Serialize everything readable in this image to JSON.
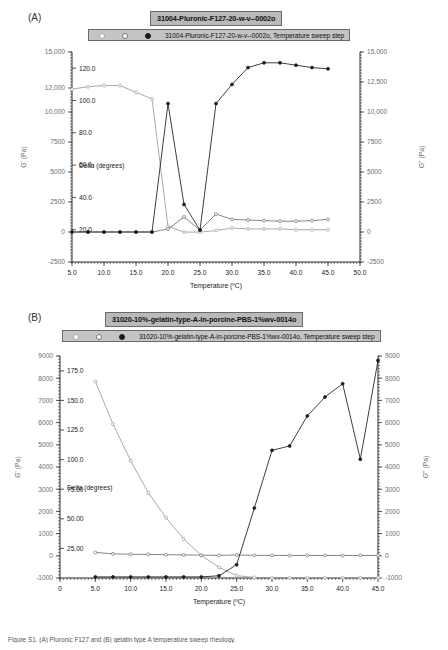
{
  "figure": {
    "caption": "Figure S1. (A) Pluronic F127 and (B) gelatin type A temperature sweep rheology."
  },
  "panels": [
    {
      "label": "(A)",
      "title": "31004-Pluronic-F127-20-w-v--0002o",
      "legend_text": "31004-Pluronic-F127-20-w-v--0002o, Temperature sweep step",
      "xlabel": "Temperature (ºC)",
      "ylabel_left": "G' (Pa)",
      "ylabel_left2": "Delta (degrees)",
      "ylabel_right": "G'' (Pa)",
      "colors": {
        "delta": "#9a9a9a",
        "gpp": "#6f6f6f",
        "gp": "#1c1c1c"
      }
    },
    {
      "label": "(B)",
      "title": "31020-10%-gelatin-type-A-in-porcine-PBS-1%wv-0014o",
      "legend_text": "31020-10%-gelatin-type-A-in-porcine-PBS-1%wv-0014o, Temperature sweep step",
      "xlabel": "Temperature (ºC)",
      "ylabel_left": "G' (Pa)",
      "ylabel_left2": "Delta (degrees)",
      "ylabel_right": "G'' (Pa)",
      "colors": {
        "delta": "#9a9a9a",
        "gpp": "#6f6f6f",
        "gp": "#1c1c1c"
      }
    }
  ],
  "chart_data": [
    {
      "type": "line",
      "title": "31004-Pluronic-F127-20-w-v--0002o",
      "subtitle": "31004-Pluronic-F127-20-w-v--0002o, Temperature sweep step",
      "xlabel": "Temperature (ºC)",
      "ylabel": "G' (Pa)",
      "ylabel_secondary": "G'' (Pa)",
      "ylabel_tertiary": "Delta (degrees)",
      "grid": false,
      "legend_position": "top",
      "xlim": [
        5.0,
        50.0
      ],
      "xticks": [
        "5.0",
        "10.0",
        "15.0",
        "20.0",
        "25.0",
        "30.0",
        "35.0",
        "40.0",
        "45.0",
        "50.0"
      ],
      "ylim_left": [
        -2500,
        15000
      ],
      "yticks_left": [
        "-2500",
        "0",
        "2500",
        "5000",
        "7500",
        "10,000",
        "12,000",
        "15,000"
      ],
      "ylim_delta": [
        0.0,
        130.0
      ],
      "yticks_delta": [
        "20.0",
        "40.0",
        "60.0",
        "80.0",
        "100.0",
        "120.0"
      ],
      "ylim_right": [
        -2500,
        15000
      ],
      "yticks_right": [
        "-2500",
        "0",
        "2500",
        "5000",
        "7500",
        "10,000",
        "12,500",
        "15,000"
      ],
      "x": [
        5.0,
        7.5,
        10.0,
        12.5,
        15.0,
        17.5,
        20.0,
        22.5,
        25.0,
        27.5,
        30.0,
        32.5,
        35.0,
        37.5,
        40.0,
        42.5,
        45.0
      ],
      "series": [
        {
          "name": "Delta (degrees)",
          "axis": "delta",
          "values": [
            107.0,
            108.5,
            109.3,
            109.2,
            105.0,
            101.0,
            22.0,
            18.5,
            18.5,
            19.5,
            21.0,
            20.5,
            20.5,
            20.5,
            20.0,
            20.0,
            20.0
          ]
        },
        {
          "name": "G'' (Pa)",
          "axis": "right",
          "values": [
            0,
            0,
            0,
            0,
            0,
            0,
            250,
            1250,
            160,
            1500,
            1050,
            1000,
            950,
            900,
            900,
            950,
            1050
          ]
        },
        {
          "name": "G' (Pa)",
          "axis": "left",
          "values": [
            0,
            0,
            0,
            0,
            0,
            0,
            10700,
            2300,
            160,
            10700,
            12300,
            13700,
            14100,
            14100,
            13900,
            13700,
            13600
          ]
        }
      ]
    },
    {
      "type": "line",
      "title": "31020-10%-gelatin-type-A-in-porcine-PBS-1%wv-0014o",
      "subtitle": "31020-10%-gelatin-type-A-in-porcine-PBS-1%wv-0014o, Temperature sweep step",
      "xlabel": "Temperature (ºC)",
      "ylabel": "G' (Pa)",
      "ylabel_secondary": "G'' (Pa)",
      "ylabel_tertiary": "Delta (degrees)",
      "grid": false,
      "legend_position": "top",
      "xlim": [
        0.0,
        45.0
      ],
      "xticks": [
        "0",
        "5.0",
        "10.0",
        "15.0",
        "20.0",
        "25.0",
        "30.0",
        "35.0",
        "40.0",
        "45.0"
      ],
      "ylim_left": [
        -1000,
        9000
      ],
      "yticks_left": [
        "-1000",
        "0",
        "1000",
        "2000",
        "3000",
        "4000",
        "5000",
        "6000",
        "7000",
        "8000",
        "9000"
      ],
      "ylim_delta": [
        0.0,
        187.5
      ],
      "yticks_delta": [
        "25.00",
        "50.00",
        "75.00",
        "100.0",
        "125.0",
        "150.0",
        "175.0"
      ],
      "ylim_right": [
        -1000,
        9000
      ],
      "yticks_right": [
        "-1000",
        "0",
        "1000",
        "2000",
        "3000",
        "4000",
        "5000",
        "6000",
        "7000",
        "8000",
        "9000"
      ],
      "x": [
        5.0,
        7.5,
        10.0,
        12.5,
        15.0,
        17.5,
        20.0,
        22.5,
        25.0,
        27.5,
        30.0,
        32.5,
        35.0,
        37.5,
        40.0,
        42.5,
        45.0
      ],
      "series": [
        {
          "name": "Delta (degrees)",
          "axis": "delta",
          "values": [
            166.0,
            130.0,
            99.0,
            72.0,
            51.0,
            33.0,
            19.0,
            9.0,
            2.0,
            0.5,
            0.3,
            0.2,
            0.2,
            0.2,
            0.2,
            0.2,
            0.2
          ]
        },
        {
          "name": "G'' (Pa)",
          "axis": "right",
          "values": [
            150,
            90,
            70,
            60,
            50,
            40,
            30,
            20,
            40,
            20,
            15,
            15,
            15,
            15,
            15,
            15,
            15
          ]
        },
        {
          "name": "G' (Pa)",
          "axis": "left",
          "values": [
            -950,
            -950,
            -950,
            -950,
            -950,
            -950,
            -950,
            -900,
            -400,
            2150,
            4750,
            4950,
            6300,
            7150,
            7750,
            4350,
            8800
          ]
        }
      ]
    }
  ]
}
